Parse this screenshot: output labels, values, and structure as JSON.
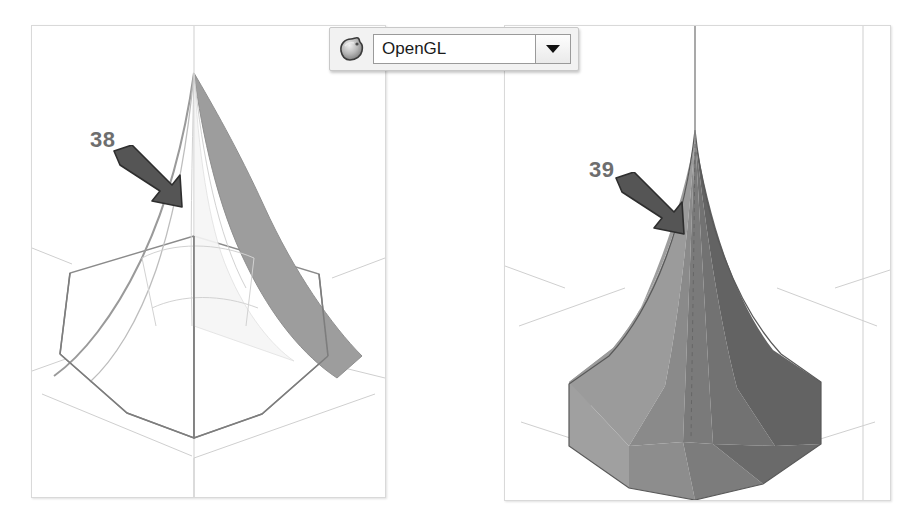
{
  "app": {
    "background_color": "#ffffff"
  },
  "toolbar": {
    "icon_name": "opengl-render-sphere-icon",
    "renderer_select": {
      "label": "OpenGL",
      "selected_value": "OpenGL",
      "options": [
        "OpenGL"
      ],
      "dropdown_icon": "chevron-down-icon"
    }
  },
  "viewports": [
    {
      "id": "left",
      "name": "wireframe-viewport",
      "render_mode": "wireframe-hidden-line",
      "background_color": "#ffffff",
      "border_color": "#d9d9d9",
      "model": {
        "name": "hexagonal-spire",
        "edge_color": "#8a8a8a",
        "shaded_face_color": "#9a9a9a",
        "light_face_color": "#f4f4f4"
      }
    },
    {
      "id": "right",
      "name": "shaded-viewport",
      "render_mode": "smooth-shaded",
      "background_color": "#ffffff",
      "border_color": "#d9d9d9",
      "model": {
        "name": "hexagonal-spire",
        "face_colors": [
          "#787878",
          "#9b9b9b",
          "#8c8c8c",
          "#6f6f6f",
          "#636363",
          "#a4a4a4"
        ],
        "edge_color": "#6b6b6b"
      }
    }
  ],
  "annotations": [
    {
      "id": "callout-38",
      "label": "38",
      "color": "#6e6e6e",
      "arrow_color": "#555555",
      "points_at": "left-viewport-spire-silhouette-edge"
    },
    {
      "id": "callout-39",
      "label": "39",
      "color": "#6e6e6e",
      "arrow_color": "#555555",
      "points_at": "right-viewport-spire-shaded-edge"
    }
  ],
  "scene": {
    "grid_line_color": "#cfcfcf",
    "axis_line_color": "#c4c4c4"
  }
}
